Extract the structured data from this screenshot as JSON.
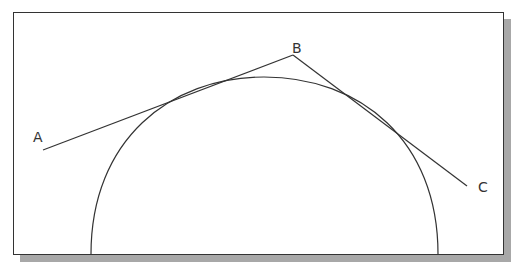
{
  "diagram": {
    "title": "",
    "labels": {
      "a": "A",
      "b": "B",
      "c": "C"
    },
    "points": {
      "A": [
        43,
        150
      ],
      "B": [
        293,
        55
      ],
      "C": [
        467,
        186
      ]
    },
    "arc": {
      "left_foot": [
        91,
        255
      ],
      "right_foot": [
        438,
        255
      ],
      "apex": [
        264,
        77
      ]
    },
    "colors": {
      "line": "#333333",
      "shadow": "#a8a8a8",
      "background": "#ffffff"
    }
  }
}
